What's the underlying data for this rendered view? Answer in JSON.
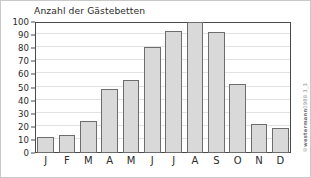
{
  "figure": {
    "title": "Anzahl der Gästebetten",
    "watermark_copyright": "©",
    "watermark_brand": "westermann",
    "watermark_code": "0988 3_3",
    "frame_color": "#c9c9c9",
    "bar_fill": "#d9d9d9",
    "bar_stroke": "#6d6d6d",
    "axis_color": "#4a4a4a",
    "grid_color": "#e2e2e2"
  },
  "chart_data": {
    "type": "bar",
    "title": "Anzahl der Gästebetten",
    "xlabel": "",
    "ylabel": "",
    "categories": [
      "J",
      "F",
      "M",
      "A",
      "M",
      "J",
      "J",
      "A",
      "S",
      "O",
      "N",
      "D"
    ],
    "category_names": [
      "Januar",
      "Februar",
      "März",
      "April",
      "Mai",
      "Juni",
      "Juli",
      "August",
      "September",
      "Oktober",
      "November",
      "Dezember"
    ],
    "values": [
      12,
      13.5,
      24.5,
      48.5,
      56,
      81,
      93,
      100,
      92,
      52.5,
      22,
      19
    ],
    "ylim": [
      0,
      100
    ],
    "ytick_step": 10,
    "yticks": [
      0,
      10,
      20,
      30,
      40,
      50,
      60,
      70,
      80,
      90,
      100
    ],
    "ytick_labels": [
      "0",
      "10",
      "20",
      "30",
      "40",
      "50",
      "60",
      "70",
      "80",
      "90",
      "100"
    ],
    "grid": true,
    "grid_axis": "y",
    "legend": false,
    "legend_position": "none"
  }
}
